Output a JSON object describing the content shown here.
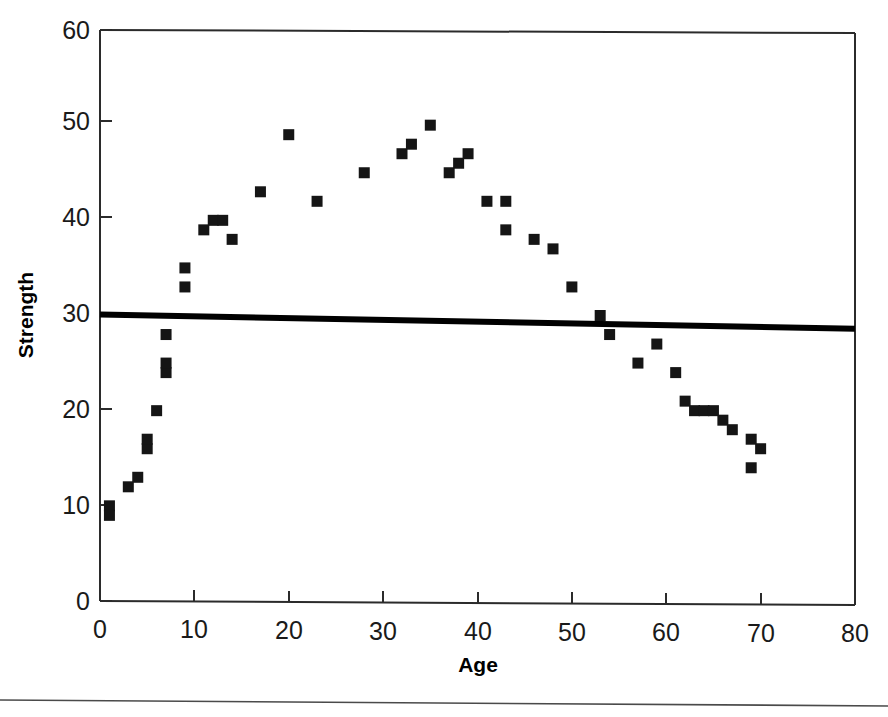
{
  "chart_data": {
    "type": "scatter",
    "title": "",
    "xlabel": "Age",
    "ylabel": "Strength",
    "xlim": [
      0,
      80
    ],
    "ylim": [
      0,
      60
    ],
    "xticks": [
      0,
      10,
      20,
      30,
      40,
      50,
      60,
      70,
      80
    ],
    "yticks": [
      0,
      10,
      20,
      30,
      40,
      50,
      60
    ],
    "xtick_labels": [
      "0",
      "10",
      "20",
      "30",
      "40",
      "50",
      "60",
      "70",
      "80"
    ],
    "ytick_labels": [
      "0",
      "10",
      "20",
      "30",
      "40",
      "50",
      "60"
    ],
    "grid": false,
    "legend": null,
    "marker": "square",
    "marker_color": "#151515",
    "series": [
      {
        "name": "Strength vs Age",
        "points": [
          [
            1,
            10
          ],
          [
            1,
            9
          ],
          [
            3,
            12
          ],
          [
            4,
            13
          ],
          [
            5,
            16
          ],
          [
            5,
            17
          ],
          [
            6,
            20
          ],
          [
            7,
            24
          ],
          [
            7,
            25
          ],
          [
            7,
            28
          ],
          [
            9,
            33
          ],
          [
            9,
            35
          ],
          [
            11,
            39
          ],
          [
            12,
            40
          ],
          [
            13,
            40
          ],
          [
            14,
            38
          ],
          [
            17,
            43
          ],
          [
            20,
            49
          ],
          [
            23,
            42
          ],
          [
            28,
            45
          ],
          [
            32,
            47
          ],
          [
            33,
            48
          ],
          [
            35,
            50
          ],
          [
            37,
            45
          ],
          [
            38,
            46
          ],
          [
            39,
            47
          ],
          [
            41,
            42
          ],
          [
            43,
            42
          ],
          [
            43,
            39
          ],
          [
            46,
            38
          ],
          [
            48,
            37
          ],
          [
            50,
            33
          ],
          [
            53,
            30
          ],
          [
            54,
            28
          ],
          [
            57,
            25
          ],
          [
            59,
            27
          ],
          [
            61,
            24
          ],
          [
            62,
            21
          ],
          [
            63,
            20
          ],
          [
            64,
            20
          ],
          [
            65,
            20
          ],
          [
            66,
            19
          ],
          [
            67,
            18
          ],
          [
            69,
            14
          ],
          [
            69,
            17
          ],
          [
            70,
            16
          ]
        ]
      }
    ],
    "trend_line": {
      "label": "fitted regression line",
      "x_start": 0,
      "y_start": 30.1,
      "x_end": 80,
      "y_end": 28.6
    }
  }
}
